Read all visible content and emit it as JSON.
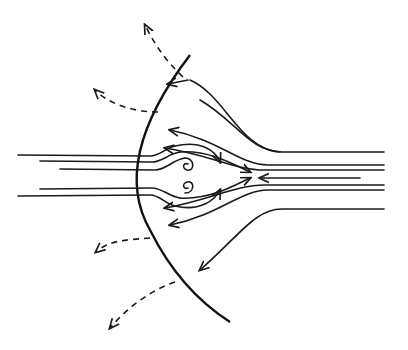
{
  "diagram": {
    "elements": [
      "curved-boundary",
      "incoming-streamlines",
      "outgoing-streamlines",
      "vortex-pair",
      "dashed-escape-arrows"
    ],
    "colors": {
      "line": "#1a1a1a",
      "background": "#ffffff"
    }
  }
}
